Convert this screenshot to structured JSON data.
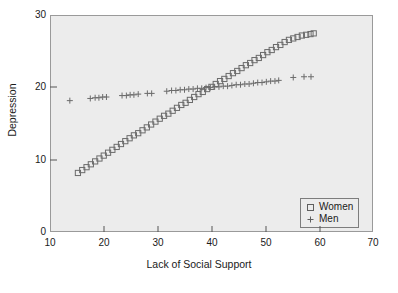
{
  "chart_data": {
    "type": "scatter",
    "title": "",
    "xlabel": "Lack of Social Support",
    "ylabel": "Depression",
    "xlim": [
      10,
      70
    ],
    "ylim": [
      0,
      30
    ],
    "xticks": [
      10,
      20,
      30,
      40,
      50,
      60,
      70
    ],
    "yticks": [
      0,
      10,
      20,
      30
    ],
    "grid": false,
    "legend_position": "bottom-right",
    "background_color": "#ececec",
    "marker_color": "#6b6b6b",
    "series": [
      {
        "name": "Women",
        "marker": "square",
        "x": [
          15.0,
          15.8,
          16.6,
          17.4,
          18.2,
          19.0,
          19.8,
          20.6,
          21.4,
          22.2,
          23.0,
          23.8,
          24.6,
          25.4,
          26.2,
          27.0,
          27.8,
          28.6,
          29.4,
          30.2,
          31.0,
          31.8,
          32.6,
          33.4,
          34.2,
          35.0,
          35.8,
          36.6,
          37.4,
          38.2,
          39.0,
          39.8,
          40.6,
          41.4,
          42.2,
          43.0,
          43.8,
          44.6,
          45.4,
          46.2,
          47.0,
          47.8,
          48.6,
          49.4,
          50.2,
          51.0,
          51.8,
          52.6,
          53.4,
          54.2,
          55.0,
          55.8,
          56.6,
          57.4,
          58.2,
          58.8
        ],
        "y": [
          8.3,
          8.7,
          9.1,
          9.5,
          9.9,
          10.3,
          10.7,
          11.1,
          11.5,
          11.9,
          12.3,
          12.7,
          13.1,
          13.5,
          13.8,
          14.2,
          14.6,
          15.0,
          15.4,
          15.8,
          16.2,
          16.5,
          16.9,
          17.3,
          17.7,
          18.0,
          18.4,
          18.8,
          19.2,
          19.5,
          19.9,
          20.2,
          20.6,
          21.0,
          21.3,
          21.7,
          22.1,
          22.4,
          22.8,
          23.2,
          23.5,
          23.9,
          24.2,
          24.6,
          25.0,
          25.3,
          25.7,
          26.0,
          26.4,
          26.7,
          26.9,
          27.1,
          27.3,
          27.4,
          27.5,
          27.6
        ]
      },
      {
        "name": "Men",
        "marker": "plus",
        "x": [
          13.5,
          17.3,
          18.2,
          18.9,
          19.6,
          20.3,
          23.2,
          24.0,
          24.7,
          25.4,
          26.2,
          27.9,
          28.7,
          31.5,
          32.4,
          33.2,
          34.0,
          34.8,
          35.6,
          36.4,
          37.2,
          38.0,
          38.8,
          39.6,
          40.4,
          41.2,
          42.0,
          42.8,
          43.6,
          44.4,
          45.2,
          46.0,
          46.8,
          47.6,
          48.4,
          49.2,
          50.0,
          50.8,
          51.6,
          52.3,
          55.0,
          57.0,
          58.3
        ],
        "y": [
          18.3,
          18.6,
          18.7,
          18.7,
          18.8,
          18.8,
          19.0,
          19.0,
          19.1,
          19.1,
          19.2,
          19.3,
          19.3,
          19.6,
          19.7,
          19.7,
          19.8,
          19.8,
          19.9,
          19.9,
          20.0,
          20.0,
          20.1,
          20.1,
          20.2,
          20.2,
          20.3,
          20.3,
          20.4,
          20.5,
          20.5,
          20.6,
          20.6,
          20.7,
          20.8,
          20.8,
          20.9,
          21.0,
          21.0,
          21.1,
          21.5,
          21.6,
          21.6
        ]
      }
    ],
    "legend": [
      {
        "label": "Women",
        "marker": "square"
      },
      {
        "label": "Men",
        "marker": "plus"
      }
    ]
  },
  "axes": {
    "x_tick_labels": [
      "10",
      "20",
      "30",
      "40",
      "50",
      "60",
      "70"
    ],
    "y_tick_labels": [
      "0",
      "10",
      "20",
      "30"
    ],
    "x_title": "Lack of Social Support",
    "y_title": "Depression"
  }
}
